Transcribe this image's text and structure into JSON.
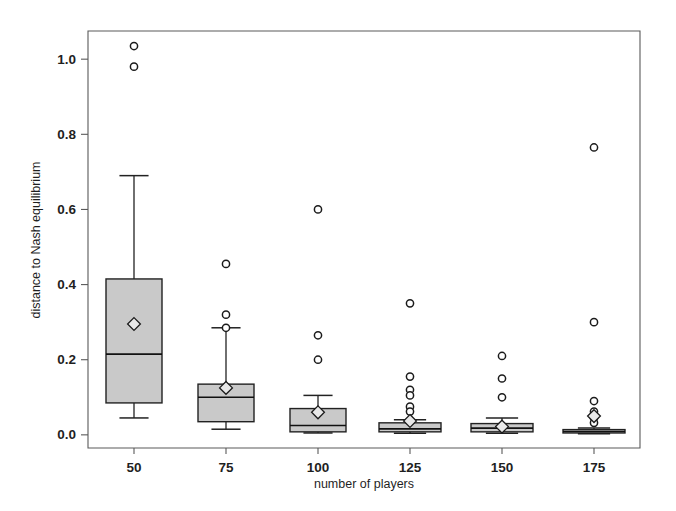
{
  "chart_data": {
    "type": "box",
    "title": "",
    "xlabel": "number of players",
    "ylabel": "distance to Nash equilibrium",
    "categories": [
      "50",
      "75",
      "100",
      "125",
      "150",
      "175"
    ],
    "xticklabels": [
      "50",
      "75",
      "100",
      "125",
      "150",
      "175"
    ],
    "yticklabels": [
      "0.0",
      "0.2",
      "0.4",
      "0.6",
      "0.8",
      "1.0"
    ],
    "ytickvalues": [
      0.0,
      0.2,
      0.4,
      0.6,
      0.8,
      1.0
    ],
    "ylim": [
      -0.035,
      1.075
    ],
    "grid": false,
    "legend": false,
    "legend_position": "none",
    "marker_notes": {
      "box_fill": "#c9c9c9",
      "outlier_symbol": "open-circle",
      "mean_symbol": "open-diamond"
    },
    "boxes": [
      {
        "category": "50",
        "whisker_low": 0.045,
        "q1": 0.085,
        "median": 0.215,
        "q3": 0.415,
        "whisker_high": 0.69,
        "mean": 0.295,
        "outliers": [
          1.035,
          0.98
        ]
      },
      {
        "category": "75",
        "whisker_low": 0.015,
        "q1": 0.035,
        "median": 0.1,
        "q3": 0.135,
        "whisker_high": 0.285,
        "mean": 0.125,
        "outliers": [
          0.455,
          0.32,
          0.285
        ]
      },
      {
        "category": "100",
        "whisker_low": 0.005,
        "q1": 0.008,
        "median": 0.025,
        "q3": 0.07,
        "whisker_high": 0.105,
        "mean": 0.06,
        "outliers": [
          0.6,
          0.265,
          0.2
        ]
      },
      {
        "category": "125",
        "whisker_low": 0.004,
        "q1": 0.008,
        "median": 0.016,
        "q3": 0.032,
        "whisker_high": 0.04,
        "mean": 0.037,
        "outliers": [
          0.35,
          0.155,
          0.12,
          0.105,
          0.075,
          0.062
        ]
      },
      {
        "category": "150",
        "whisker_low": 0.004,
        "q1": 0.008,
        "median": 0.018,
        "q3": 0.03,
        "whisker_high": 0.045,
        "mean": 0.022,
        "outliers": [
          0.21,
          0.15,
          0.1
        ]
      },
      {
        "category": "175",
        "whisker_low": 0.003,
        "q1": 0.005,
        "median": 0.009,
        "q3": 0.014,
        "whisker_high": 0.018,
        "mean": 0.05,
        "outliers": [
          0.765,
          0.3,
          0.09,
          0.062,
          0.045,
          0.032
        ]
      }
    ]
  },
  "figure": {
    "xaxis_title": "number of players",
    "yaxis_title": "distance to Nash equilibrium"
  }
}
